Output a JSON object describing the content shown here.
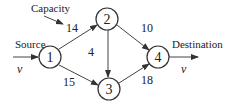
{
  "diagram": {
    "type": "flow-network",
    "labels": {
      "capacity": "Capacity",
      "source": "Source",
      "destination": "Destination",
      "source_flow": "v",
      "dest_flow": "v"
    },
    "nodes": [
      {
        "id": "1",
        "label": "1",
        "x": 50,
        "y": 57
      },
      {
        "id": "2",
        "label": "2",
        "x": 107,
        "y": 19
      },
      {
        "id": "3",
        "label": "3",
        "x": 109,
        "y": 89
      },
      {
        "id": "4",
        "label": "4",
        "x": 158,
        "y": 57
      }
    ],
    "edges": [
      {
        "from": "1",
        "to": "2",
        "capacity": "14"
      },
      {
        "from": "1",
        "to": "3",
        "capacity": "15"
      },
      {
        "from": "2",
        "to": "3",
        "capacity": "4"
      },
      {
        "from": "2",
        "to": "4",
        "capacity": "10"
      },
      {
        "from": "3",
        "to": "4",
        "capacity": "18"
      }
    ]
  }
}
